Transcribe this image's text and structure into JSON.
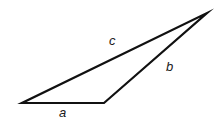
{
  "figure": {
    "type": "triangle-diagram",
    "background_color": "#ffffff",
    "stroke_color": "#111111",
    "stroke_width": 2.2,
    "canvas": {
      "width": 216,
      "height": 125
    },
    "vertices": [
      {
        "name": "vertex-left",
        "x": 22,
        "y": 103
      },
      {
        "name": "vertex-bottom-right",
        "x": 104,
        "y": 103
      },
      {
        "name": "vertex-apex",
        "x": 207,
        "y": 13
      }
    ],
    "sides": [
      {
        "label": "a",
        "name": "side-a-base",
        "from": "vertex-left",
        "to": "vertex-bottom-right",
        "label_x": 59,
        "label_y": 106
      },
      {
        "label": "b",
        "name": "side-b-right",
        "from": "vertex-bottom-right",
        "to": "vertex-apex",
        "label_x": 166,
        "label_y": 60
      },
      {
        "label": "c",
        "name": "side-c-long",
        "from": "vertex-left",
        "to": "vertex-apex",
        "label_x": 109,
        "label_y": 34
      }
    ],
    "polygon_points": "22,103 104,103 207,13"
  }
}
